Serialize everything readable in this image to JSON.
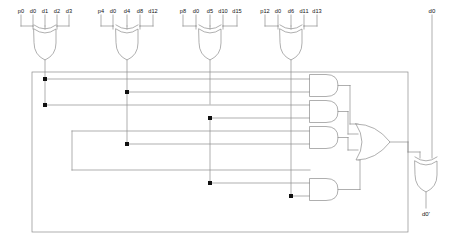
{
  "diagram": {
    "stroke_color": "#888888",
    "junction_color": "#111111",
    "background": "#ffffff"
  },
  "input_groups": [
    {
      "name": "parity-group-p0",
      "gate": "xor-gate-p0",
      "labels": [
        "p0",
        "d0",
        "d1",
        "d2",
        "d3"
      ]
    },
    {
      "name": "parity-group-p4",
      "gate": "xor-gate-p4",
      "labels": [
        "p4",
        "d0",
        "d4",
        "d8",
        "d12"
      ]
    },
    {
      "name": "parity-group-p8",
      "gate": "xor-gate-p8",
      "labels": [
        "p8",
        "d0",
        "d5",
        "d10",
        "d15"
      ]
    },
    {
      "name": "parity-group-p12",
      "gate": "xor-gate-p12",
      "labels": [
        "p12",
        "d0",
        "d6",
        "d11",
        "d13"
      ]
    }
  ],
  "right_rail": {
    "data_input_label": "d0",
    "output_label": "d0'"
  },
  "gates": {
    "and_gates": [
      "and-gate-1",
      "and-gate-2",
      "and-gate-3",
      "and-gate-4"
    ],
    "or_gate": "or-gate-1",
    "output_xor_gate": "xor-gate-out"
  }
}
